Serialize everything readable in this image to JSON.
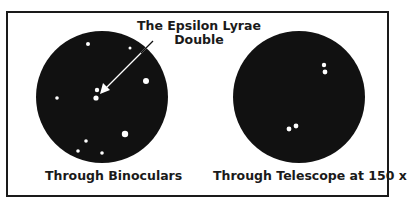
{
  "figure": {
    "callout": {
      "line1": "The Epsilon Lyrae",
      "line2": "Double"
    },
    "panels": [
      {
        "caption": "Through Binoculars",
        "view": "binoculars-field",
        "circle": {
          "cx": 102,
          "cy": 97,
          "r": 66
        },
        "stars": [
          {
            "x": 88,
            "y": 44,
            "r": 2
          },
          {
            "x": 130,
            "y": 48,
            "r": 1.5
          },
          {
            "x": 146,
            "y": 81,
            "r": 3
          },
          {
            "x": 57,
            "y": 98,
            "r": 1.8
          },
          {
            "x": 97,
            "y": 90,
            "r": 2.2
          },
          {
            "x": 96,
            "y": 98,
            "r": 2.6
          },
          {
            "x": 125,
            "y": 134,
            "r": 3.2
          },
          {
            "x": 86,
            "y": 141,
            "r": 1.8
          },
          {
            "x": 78,
            "y": 151,
            "r": 1.8
          },
          {
            "x": 102,
            "y": 153,
            "r": 1.8
          }
        ]
      },
      {
        "caption": "Through Telescope at 150 x",
        "view": "telescope-field",
        "circle": {
          "cx": 299,
          "cy": 97,
          "r": 66
        },
        "stars": [
          {
            "x": 324,
            "y": 65,
            "r": 2.2
          },
          {
            "x": 325,
            "y": 72,
            "r": 2.4
          },
          {
            "x": 296,
            "y": 126,
            "r": 2.4
          },
          {
            "x": 289,
            "y": 129,
            "r": 2.4
          }
        ]
      }
    ],
    "colors": {
      "ink": "#111111",
      "paper": "#ffffff",
      "star": "#ffffff"
    }
  }
}
